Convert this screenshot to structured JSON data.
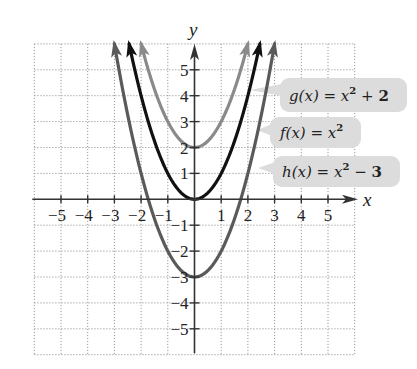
{
  "chart_data": {
    "type": "line",
    "title": "",
    "xlabel": "x",
    "ylabel": "y",
    "xlim": [
      -6,
      6
    ],
    "ylim": [
      -6,
      6
    ],
    "grid": true,
    "grid_style": "dotted",
    "x_ticks": [
      -5,
      -4,
      -3,
      -2,
      -1,
      1,
      2,
      3,
      4,
      5
    ],
    "y_ticks": [
      5,
      4,
      3,
      2,
      1,
      -1,
      -2,
      -3,
      -4,
      -5
    ],
    "x_tick_labels": [
      "−5",
      "−4",
      "−3",
      "−2",
      "−1",
      "1",
      "2",
      "3",
      "4",
      "5"
    ],
    "y_tick_labels": [
      "5",
      "4",
      "3",
      "2",
      "1",
      "−1",
      "−2",
      "−3",
      "−4",
      "−5"
    ],
    "series": [
      {
        "name": "g(x) = x² + 2",
        "expression": "x^2 + 2",
        "vertex": [
          0,
          2
        ],
        "x_range": [
          -2,
          2
        ],
        "color": "#8a8a8a",
        "label_parts": {
          "fn": "g(x) = x",
          "exp": "2",
          "tail": " + ",
          "num": "2"
        }
      },
      {
        "name": "f(x) = x²",
        "expression": "x^2",
        "vertex": [
          0,
          0
        ],
        "x_range": [
          -2.449,
          2.449
        ],
        "color": "#111111",
        "label_parts": {
          "fn": "f(x) = x",
          "exp": "2",
          "tail": "",
          "num": ""
        }
      },
      {
        "name": "h(x) = x² − 3",
        "expression": "x^2 - 3",
        "vertex": [
          0,
          -3
        ],
        "x_range": [
          -3,
          3
        ],
        "color": "#5a5a5a",
        "label_parts": {
          "fn": "h(x) = x",
          "exp": "2",
          "tail": " − ",
          "num": "3"
        }
      }
    ],
    "legend_position": "right, callout boxes pointing to curves",
    "label_box_color": "#dcdcdc"
  }
}
